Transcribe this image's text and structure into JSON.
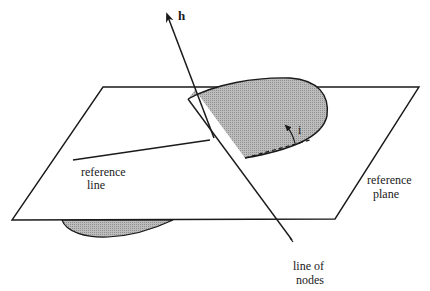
{
  "diagram": {
    "title": "",
    "labels": {
      "h_vector": "h",
      "reference_line_1": "reference",
      "reference_line_2": "line",
      "inclination": "i",
      "reference_plane_1": "reference",
      "reference_plane_2": "plane",
      "line_of_nodes_1": "line of",
      "line_of_nodes_2": "nodes"
    },
    "colors": {
      "stroke": "#1a1a1a",
      "orbit_fill": "#a8a8a8",
      "background": "#ffffff"
    }
  }
}
